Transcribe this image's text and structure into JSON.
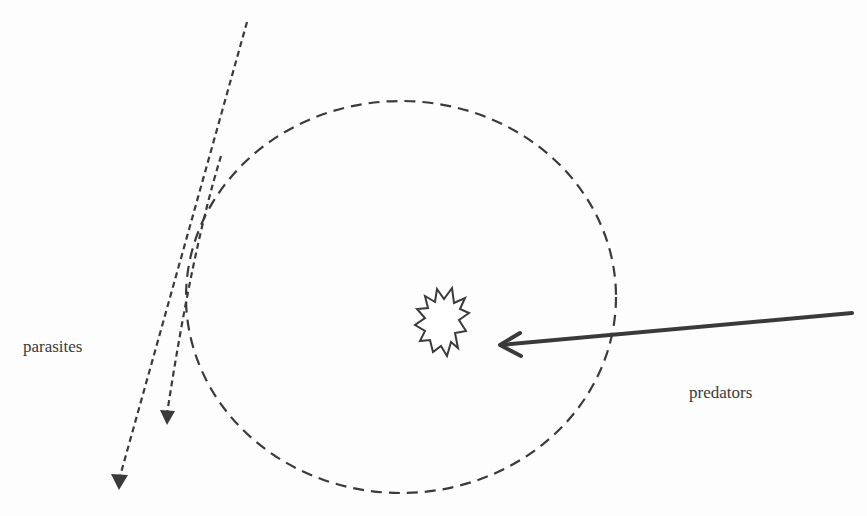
{
  "diagram": {
    "labels": {
      "parasites": "parasites",
      "predators": "predators"
    },
    "colors": {
      "background": "#fdfdfd",
      "stroke": "#3a3a3a",
      "text": "#3a3a3a"
    },
    "elements": [
      {
        "id": "boundary-circle",
        "kind": "ellipse",
        "style": "dashed",
        "description": "dashed circular boundary around the target"
      },
      {
        "id": "target-burst",
        "kind": "star-burst",
        "style": "solid-outline",
        "description": "spiky burst at the center of the circle"
      },
      {
        "id": "predator-arrow",
        "kind": "arrow",
        "style": "solid-thick",
        "from": "right edge",
        "to": "burst",
        "label": "predators"
      },
      {
        "id": "parasite-arrow-long",
        "kind": "arrow",
        "style": "dotted",
        "from": "top",
        "to": "bottom-left, outside circle",
        "label": "parasites"
      },
      {
        "id": "parasite-arrow-short",
        "kind": "arrow",
        "style": "dotted",
        "from": "circle edge",
        "to": "bottom-left, near circle",
        "label": "parasites"
      }
    ]
  }
}
